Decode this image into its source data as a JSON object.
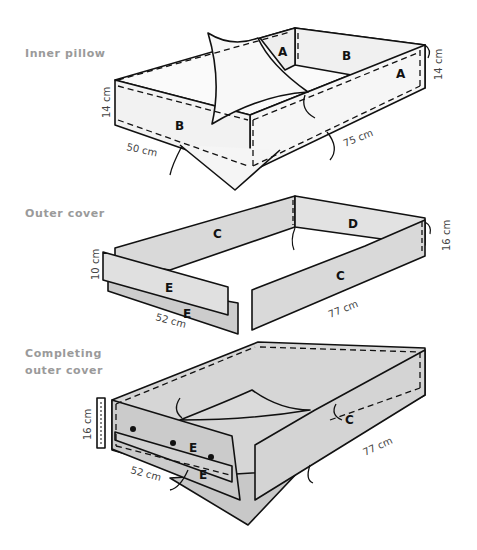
{
  "sections": [
    {
      "title": "Inner pillow",
      "dimensions": {
        "height_left": "14 cm",
        "height_right": "14 cm",
        "width": "50 cm",
        "length": "75 cm"
      },
      "panel_labels": [
        "A",
        "B",
        "A",
        "B"
      ]
    },
    {
      "title": "Outer cover",
      "dimensions": {
        "height_left": "10 cm",
        "height_right": "16 cm",
        "width": "52 cm",
        "length": "77 cm"
      },
      "panel_labels": [
        "C",
        "D",
        "C",
        "E",
        "E"
      ]
    },
    {
      "title_line1": "Completing",
      "title_line2": "outer cover",
      "dimensions": {
        "height_left": "16 cm",
        "width": "52 cm",
        "length": "77 cm"
      },
      "panel_labels": [
        "C",
        "E",
        "E"
      ]
    }
  ],
  "colors": {
    "label_text": "#9a9a9a",
    "fabric_light": "#f2f2f2",
    "fabric_outer": "#d9d9d9",
    "fabric_complete": "#cfcfcf",
    "outline": "#111111"
  }
}
